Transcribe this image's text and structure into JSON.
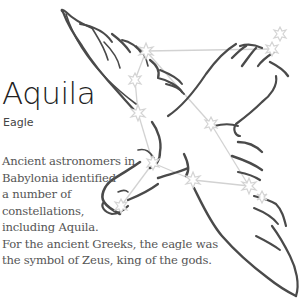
{
  "constellation": {
    "name": "Aquila",
    "common_name": "Eagle",
    "description_lines": [
      "Ancient astronomers in",
      "Babylonia identified",
      "a number of",
      "constellations,",
      "including Aquila.",
      "For the ancient Greeks, the eagle was",
      "the symbol of Zeus, king of the gods."
    ]
  },
  "colors": {
    "outline": "#4a4a4a",
    "star": "#d9d9d9",
    "line": "#cfcfcf",
    "title": "#222222",
    "body_text": "#555555"
  },
  "stars": [
    {
      "id": "s1",
      "x": 146,
      "y": 51
    },
    {
      "id": "s2",
      "x": 135,
      "y": 80
    },
    {
      "id": "s3",
      "x": 138,
      "y": 113
    },
    {
      "id": "s4",
      "x": 280,
      "y": 34
    },
    {
      "id": "s5",
      "x": 272,
      "y": 49
    },
    {
      "id": "s6",
      "x": 211,
      "y": 124
    },
    {
      "id": "s7",
      "x": 153,
      "y": 163
    },
    {
      "id": "s8",
      "x": 193,
      "y": 180
    },
    {
      "id": "s9",
      "x": 249,
      "y": 186
    },
    {
      "id": "s10",
      "x": 262,
      "y": 197
    },
    {
      "id": "s11",
      "x": 121,
      "y": 206
    }
  ]
}
